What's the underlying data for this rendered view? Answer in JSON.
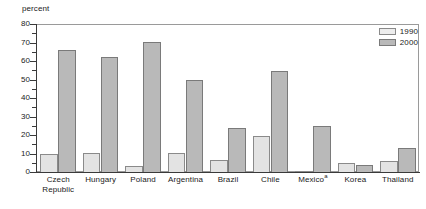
{
  "chart_data": {
    "type": "bar",
    "title": "",
    "subtitle": "",
    "xlabel": "",
    "ylabel": "percent",
    "ylim": [
      0,
      80
    ],
    "ytick_step": 10,
    "yminor_step": 5,
    "grid": false,
    "legend_position": "top-right",
    "categories": [
      "Czech Republic",
      "Hungary",
      "Poland",
      "Argentina",
      "Brazil",
      "Chile",
      "Mexico",
      "Korea",
      "Thailand"
    ],
    "category_labels": [
      [
        "Czech",
        "Republic"
      ],
      [
        "Hungary"
      ],
      [
        "Poland"
      ],
      [
        "Argentina"
      ],
      [
        "Brazil"
      ],
      [
        "Chile"
      ],
      [
        "Mexico",
        ""
      ],
      [
        "Korea"
      ],
      [
        "Thailand"
      ]
    ],
    "category_footnotes": [
      "",
      "",
      "",
      "",
      "",
      "",
      "a",
      "",
      ""
    ],
    "series": [
      {
        "name": "1990",
        "color": "#e3e3e3",
        "values": [
          10.0,
          10.3,
          3.2,
          10.5,
          6.3,
          19.7,
          0.3,
          4.7,
          5.8
        ]
      },
      {
        "name": "2000",
        "color": "#b9b9b9",
        "values": [
          66.0,
          62.2,
          70.4,
          49.6,
          23.7,
          54.8,
          24.8,
          3.7,
          13.2
        ]
      }
    ],
    "ytick_labels": [
      "0",
      "10",
      "20",
      "30",
      "40",
      "50",
      "60",
      "70",
      "80"
    ],
    "ytick_values": [
      0,
      10,
      20,
      30,
      40,
      50,
      60,
      70,
      80
    ]
  },
  "legend": {
    "items": [
      {
        "label": "1990",
        "swatch": "light-gray-swatch"
      },
      {
        "label": "2000",
        "swatch": "dark-gray-swatch"
      }
    ]
  },
  "axis": {
    "unit_caption": "percent"
  }
}
